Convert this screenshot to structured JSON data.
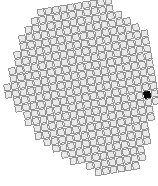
{
  "canvas": {
    "width": 158,
    "height": 186,
    "background_color": "#ffffff"
  },
  "grid": {
    "name": "rotated-cell-grid",
    "rotation_degrees": -9.5,
    "cell_pitch_px": 7.6,
    "cell_size_px": 6.3,
    "origin_x": 6,
    "origin_y": 4,
    "columns": 20,
    "rows": 23,
    "cell_fill_color": "#e9e9e9",
    "cell_stroke_color": "#8a8a8a",
    "cell_stroke_width": 0.9,
    "selected_fill_color": "#0b0b0b",
    "selected_stroke_color": "#0b0b0b",
    "selected_cell": {
      "col": 18,
      "row": 13
    },
    "occupancy": [
      "00000011111111110000",
      "00000111111111110000",
      "00001111111111111000",
      "00011111111111111100",
      "00011111111111111110",
      "00111111111111111111",
      "00111111111111111111",
      "01111111111111111111",
      "01111111111111111111",
      "11111111111111111111",
      "11111111111111111111",
      "01111111111111111111",
      "01111111111111111111",
      "00111111111111111111",
      "00111111111111111111",
      "00011111111111111110",
      "00011111111111111110",
      "00001111111111111100",
      "00000111111111111100",
      "00000011111111111100",
      "00000001111111111000",
      "00000000011111111000",
      "00000000001111110000"
    ]
  }
}
